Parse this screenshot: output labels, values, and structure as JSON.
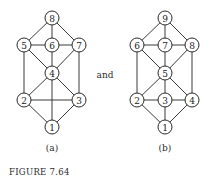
{
  "connector_text": "and",
  "figure_caption": "FIGURE 7.64",
  "graphs": [
    {
      "label": "(a)",
      "nodes": [
        {
          "id": "1",
          "x": 52,
          "y": 127
        },
        {
          "id": "2",
          "x": 24,
          "y": 100
        },
        {
          "id": "3",
          "x": 79,
          "y": 100
        },
        {
          "id": "4",
          "x": 52,
          "y": 73
        },
        {
          "id": "5",
          "x": 24,
          "y": 45
        },
        {
          "id": "6",
          "x": 52,
          "y": 45
        },
        {
          "id": "7",
          "x": 79,
          "y": 45
        },
        {
          "id": "8",
          "x": 52,
          "y": 18
        }
      ],
      "edges": [
        [
          "8",
          "5"
        ],
        [
          "8",
          "6"
        ],
        [
          "8",
          "7"
        ],
        [
          "5",
          "6"
        ],
        [
          "6",
          "7"
        ],
        [
          "5",
          "4"
        ],
        [
          "6",
          "4"
        ],
        [
          "7",
          "4"
        ],
        [
          "5",
          "2"
        ],
        [
          "7",
          "3"
        ],
        [
          "4",
          "2"
        ],
        [
          "4",
          "3"
        ],
        [
          "4",
          "1"
        ],
        [
          "2",
          "3"
        ],
        [
          "2",
          "1"
        ],
        [
          "3",
          "1"
        ]
      ]
    },
    {
      "label": "(b)",
      "nodes": [
        {
          "id": "1",
          "x": 165,
          "y": 127
        },
        {
          "id": "2",
          "x": 137,
          "y": 100
        },
        {
          "id": "3",
          "x": 165,
          "y": 100
        },
        {
          "id": "4",
          "x": 192,
          "y": 100
        },
        {
          "id": "5",
          "x": 165,
          "y": 73
        },
        {
          "id": "6",
          "x": 137,
          "y": 45
        },
        {
          "id": "7",
          "x": 165,
          "y": 45
        },
        {
          "id": "8",
          "x": 192,
          "y": 45
        },
        {
          "id": "9",
          "x": 165,
          "y": 18
        }
      ],
      "edges": [
        [
          "9",
          "6"
        ],
        [
          "9",
          "7"
        ],
        [
          "9",
          "8"
        ],
        [
          "6",
          "7"
        ],
        [
          "7",
          "8"
        ],
        [
          "6",
          "5"
        ],
        [
          "7",
          "5"
        ],
        [
          "8",
          "5"
        ],
        [
          "6",
          "2"
        ],
        [
          "8",
          "4"
        ],
        [
          "5",
          "2"
        ],
        [
          "5",
          "3"
        ],
        [
          "5",
          "4"
        ],
        [
          "2",
          "3"
        ],
        [
          "3",
          "4"
        ],
        [
          "2",
          "1"
        ],
        [
          "3",
          "1"
        ],
        [
          "4",
          "1"
        ]
      ]
    }
  ],
  "style": {
    "node_radius": 7,
    "line_color": "#3a3a3a",
    "background": "#ffffff"
  }
}
